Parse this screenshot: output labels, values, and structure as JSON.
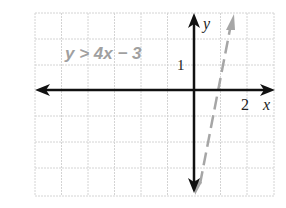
{
  "graph": {
    "inequality_label": "y > 4x − 3",
    "y_axis_label": "y",
    "x_axis_label": "x",
    "y_tick_label": "1",
    "x_tick_label": "2",
    "boundary_line": {
      "equation": "y = 4x − 3",
      "style": "dashed",
      "color": "#a6a6a6"
    },
    "axis_color": "#111111",
    "grid_color": "#cfcfcf",
    "label_color": "#a0a0a0"
  }
}
